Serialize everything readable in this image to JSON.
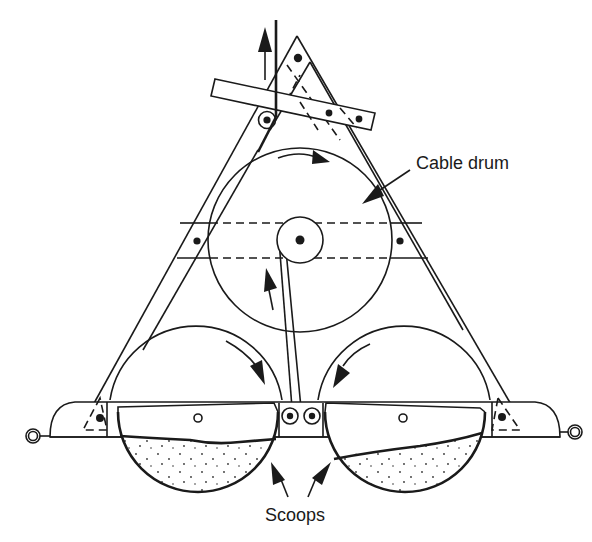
{
  "figure": {
    "labels": {
      "cable_drum": "Cable drum",
      "scoops": "Scoops"
    },
    "components": [
      "triangular-frame",
      "lever-bar",
      "pulley",
      "cable",
      "cable-drum",
      "drum-hub",
      "left-scoop-drum",
      "right-scoop-drum",
      "base-bar",
      "left-scoop",
      "right-scoop",
      "left-eyelet",
      "right-eyelet"
    ],
    "colors": {
      "ink": "#1a1a1a",
      "background": "#ffffff"
    }
  }
}
